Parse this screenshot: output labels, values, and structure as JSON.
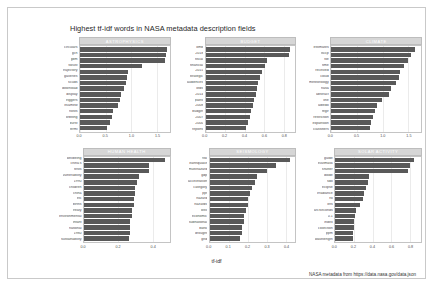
{
  "title": "Highest tf-idf words in NASA metadata description fields",
  "xlabel": "tf-idf",
  "caption": "NASA metadata from https://data.nasa.gov/data.json",
  "colors": {
    "bar": "#595959",
    "strip": "#d6d6d6",
    "grid": "#ebebeb",
    "panel_border": "#c4c4c4",
    "frame": "#c9c9c9",
    "background": "#ffffff",
    "text": "#262626"
  },
  "chart_data": {
    "type": "bar",
    "orientation": "horizontal",
    "title": "Highest tf-idf words in NASA metadata description fields",
    "xlabel": "tf-idf",
    "ylabel": "",
    "grid": true,
    "legend": "none",
    "facets": [
      {
        "name": "ASTROPHYSICS",
        "xlim": [
          0,
          1.75
        ],
        "xticks": [
          0.0,
          0.5,
          1.0,
          1.5
        ],
        "categories": [
          "circulars",
          "gcn",
          "gbm",
          "swust",
          "trajectory",
          "galleries",
          "scuds",
          "download",
          "display",
          "triggers",
          "itsamew",
          "hosts",
          "orbiting",
          "burst",
          "fermi"
        ],
        "values": [
          1.7,
          1.68,
          1.66,
          1.21,
          0.94,
          0.92,
          0.9,
          0.86,
          0.8,
          0.79,
          0.75,
          0.64,
          0.62,
          0.58,
          0.52
        ]
      },
      {
        "name": "BUDGET",
        "xlim": [
          0,
          0.92
        ],
        "xticks": [
          0.0,
          0.2,
          0.4,
          0.6,
          0.8
        ],
        "categories": [
          "omb",
          "2018",
          "fiscal",
          "financial",
          "2015",
          "strategic",
          "audiences",
          "ofds",
          "2014",
          "plans",
          "2008",
          "budget",
          "2007",
          "2000",
          "reports"
        ],
        "values": [
          0.87,
          0.85,
          0.63,
          0.61,
          0.58,
          0.56,
          0.54,
          0.53,
          0.52,
          0.5,
          0.49,
          0.47,
          0.45,
          0.43,
          0.41
        ]
      },
      {
        "name": "CLIMATE",
        "xlim": [
          0,
          1.75
        ],
        "xticks": [
          0.0,
          0.5,
          1.0,
          1.5
        ],
        "categories": [
          "estimates",
          "isccp",
          "file",
          "time",
          "received",
          "cloud",
          "meteorology",
          "nasa",
          "abstract",
          "line",
          "albedo",
          "regir",
          "restriction",
          "expansion",
          "classifiers"
        ],
        "values": [
          1.63,
          1.55,
          1.5,
          1.42,
          1.35,
          1.33,
          1.26,
          1.17,
          1.12,
          0.99,
          0.89,
          0.86,
          0.81,
          0.78,
          0.76
        ]
      },
      {
        "name": "HUMAN HEALTH",
        "xlim": [
          0,
          0.5
        ],
        "xticks": [
          0.0,
          0.2,
          0.4
        ],
        "categories": [
          "wellbeing",
          "china's",
          "tests",
          "vulnerability",
          "1990",
          "children",
          "china",
          "etc",
          "births",
          "treaty",
          "environmental",
          "infant",
          "national",
          "1980",
          "sustainability"
        ],
        "values": [
          0.47,
          0.38,
          0.38,
          0.32,
          0.31,
          0.3,
          0.3,
          0.29,
          0.29,
          0.28,
          0.28,
          0.27,
          0.27,
          0.27,
          0.26
        ]
      },
      {
        "name": "SEISMOLOGY",
        "xlim": [
          0,
          0.45
        ],
        "xticks": [
          0.0,
          0.1,
          0.2,
          0.3,
          0.4
        ],
        "categories": [
          "risk",
          "earthquake",
          "multihazard",
          "gdp",
          "acceleration",
          "category",
          "ppt",
          "hazard",
          "hazards",
          "loss",
          "economic",
          "subnational",
          "bank",
          "drought",
          "grid"
        ],
        "values": [
          0.42,
          0.35,
          0.3,
          0.25,
          0.24,
          0.22,
          0.21,
          0.2,
          0.2,
          0.19,
          0.18,
          0.18,
          0.17,
          0.17,
          0.16
        ]
      },
      {
        "name": "SOLAR ACTIVITY",
        "xlim": [
          0,
          0.92
        ],
        "xticks": [
          0.0,
          0.2,
          0.4,
          0.6,
          0.8
        ],
        "categories": [
          "guide",
          "euvimask",
          "shutter",
          "diode",
          "sdo",
          "eclipse",
          "irradiance",
          "fsi",
          "lets",
          "arcSeconds",
          "0.1",
          "index",
          "collection",
          "ppm",
          "wavelength"
        ],
        "values": [
          0.85,
          0.8,
          0.78,
          0.36,
          0.35,
          0.33,
          0.31,
          0.3,
          0.27,
          0.22,
          0.21,
          0.2,
          0.2,
          0.19,
          0.19
        ]
      }
    ]
  }
}
